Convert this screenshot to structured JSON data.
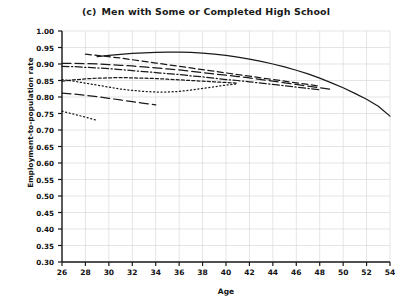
{
  "chart_data": {
    "type": "line",
    "panel_letter": "(c)",
    "title_text": "Men with Some or Completed High School",
    "xlabel": "Age",
    "ylabel": "Employment-to-population rate",
    "xlim": [
      26,
      54
    ],
    "ylim": [
      0.3,
      1.0
    ],
    "grid": true,
    "legend": "none",
    "xticks": [
      26,
      28,
      30,
      32,
      34,
      36,
      38,
      40,
      42,
      44,
      46,
      48,
      50,
      52,
      54
    ],
    "yticks": [
      "1.00",
      "0.95",
      "0.90",
      "0.85",
      "0.80",
      "0.75",
      "0.70",
      "0.65",
      "0.60",
      "0.55",
      "0.50",
      "0.45",
      "0.40",
      "0.35",
      "0.30"
    ],
    "ytick_values": [
      1.0,
      0.95,
      0.9,
      0.85,
      0.8,
      0.75,
      0.7,
      0.65,
      0.6,
      0.55,
      0.5,
      0.45,
      0.4,
      0.35,
      0.3
    ],
    "line_color": "#1a1a1a",
    "grid_color": "#d9d9d9",
    "axis_color": "#1a1a1a",
    "series": [
      {
        "name": "cohort-solid",
        "dash": "none",
        "x": [
          29,
          30,
          31,
          32,
          33,
          34,
          35,
          36,
          37,
          38,
          39,
          40,
          41,
          42,
          43,
          44,
          45,
          46,
          47,
          48,
          49,
          50,
          51,
          52,
          53,
          54
        ],
        "values": [
          0.922,
          0.926,
          0.929,
          0.932,
          0.934,
          0.935,
          0.936,
          0.936,
          0.935,
          0.933,
          0.93,
          0.926,
          0.921,
          0.915,
          0.908,
          0.9,
          0.891,
          0.881,
          0.87,
          0.857,
          0.843,
          0.828,
          0.811,
          0.793,
          0.772,
          0.742
        ]
      },
      {
        "name": "cohort-long-dash",
        "dash": "long",
        "x": [
          26,
          27,
          28,
          29,
          30,
          31,
          32,
          33,
          34,
          35,
          36,
          37,
          38,
          39,
          40,
          41,
          42,
          43,
          44,
          45,
          46,
          47,
          48,
          49
        ],
        "values": [
          0.902,
          0.902,
          0.901,
          0.9,
          0.898,
          0.896,
          0.894,
          0.891,
          0.888,
          0.885,
          0.882,
          0.878,
          0.874,
          0.87,
          0.866,
          0.862,
          0.858,
          0.853,
          0.848,
          0.843,
          0.838,
          0.833,
          0.828,
          0.823
        ]
      },
      {
        "name": "cohort-medium-dash",
        "dash": "medium",
        "x": [
          28,
          29,
          30,
          31,
          32,
          33,
          34,
          35,
          36,
          37,
          38,
          39,
          40,
          41,
          42,
          43,
          44,
          45,
          46,
          47,
          48
        ],
        "values": [
          0.93,
          0.926,
          0.922,
          0.918,
          0.913,
          0.908,
          0.903,
          0.898,
          0.893,
          0.888,
          0.883,
          0.878,
          0.873,
          0.868,
          0.863,
          0.858,
          0.853,
          0.848,
          0.843,
          0.838,
          0.833
        ]
      },
      {
        "name": "cohort-dash-dot",
        "dash": "dashdot",
        "x": [
          26,
          27,
          28,
          29,
          30,
          31,
          32,
          33,
          34,
          35,
          36,
          37,
          38,
          39,
          40,
          41,
          42,
          43,
          44,
          45,
          46,
          47,
          48
        ],
        "values": [
          0.893,
          0.892,
          0.89,
          0.888,
          0.886,
          0.883,
          0.88,
          0.877,
          0.874,
          0.871,
          0.868,
          0.864,
          0.861,
          0.857,
          0.853,
          0.85,
          0.846,
          0.842,
          0.838,
          0.834,
          0.83,
          0.826,
          0.822
        ]
      },
      {
        "name": "cohort-short-dash",
        "dash": "short",
        "x": [
          26,
          27,
          28,
          29,
          30,
          31,
          32,
          33,
          34,
          35,
          36,
          37,
          38,
          39,
          40,
          41
        ],
        "values": [
          0.848,
          0.852,
          0.855,
          0.857,
          0.858,
          0.859,
          0.858,
          0.857,
          0.856,
          0.854,
          0.852,
          0.85,
          0.848,
          0.846,
          0.844,
          0.842
        ]
      },
      {
        "name": "cohort-fine-dot",
        "dash": "dot",
        "x": [
          26,
          27,
          28,
          29,
          30,
          31,
          32,
          33,
          34,
          35,
          36,
          37,
          38,
          39,
          40,
          41
        ],
        "values": [
          0.853,
          0.848,
          0.842,
          0.836,
          0.83,
          0.824,
          0.82,
          0.817,
          0.815,
          0.815,
          0.817,
          0.821,
          0.826,
          0.831,
          0.836,
          0.84
        ]
      },
      {
        "name": "cohort-lower-long-dash",
        "dash": "long",
        "x": [
          26,
          27,
          28,
          29,
          30,
          31,
          32,
          33,
          34
        ],
        "values": [
          0.812,
          0.809,
          0.805,
          0.801,
          0.796,
          0.791,
          0.786,
          0.781,
          0.776
        ]
      },
      {
        "name": "cohort-start-dot",
        "dash": "dot",
        "x": [
          26,
          27,
          28,
          29
        ],
        "values": [
          0.757,
          0.748,
          0.739,
          0.729
        ]
      }
    ]
  }
}
